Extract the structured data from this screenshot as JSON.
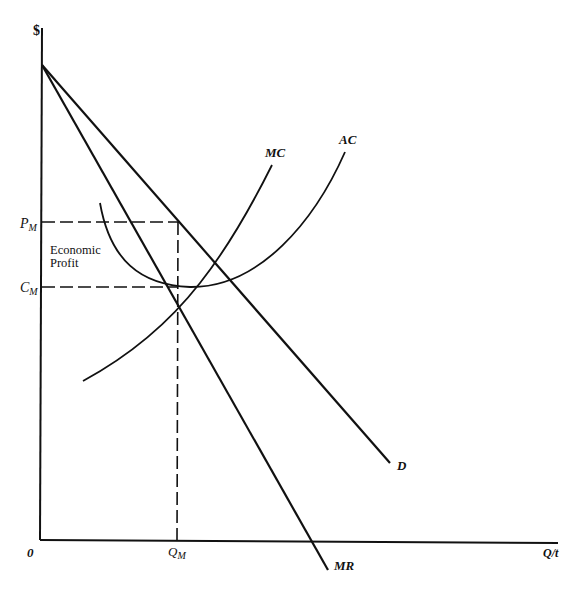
{
  "diagram": {
    "axes": {
      "y_label": "$",
      "x_label": "Q/t",
      "origin_label": "0"
    },
    "curves": {
      "demand": {
        "label": "D"
      },
      "marginal_revenue": {
        "label": "MR"
      },
      "marginal_cost": {
        "label": "MC"
      },
      "average_cost": {
        "label": "AC"
      }
    },
    "markers": {
      "price": {
        "main": "P",
        "sub": "M"
      },
      "cost": {
        "main": "C",
        "sub": "M"
      },
      "quantity": {
        "main": "Q",
        "sub": "M"
      }
    },
    "annotation": {
      "line1": "Economic",
      "line2": "Profit"
    },
    "colors": {
      "ink": "#111111",
      "background": "#ffffff"
    }
  }
}
